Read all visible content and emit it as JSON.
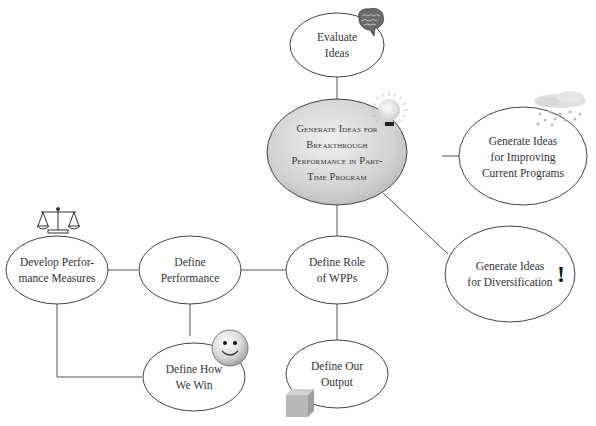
{
  "diagram": {
    "nodes": {
      "evaluate": {
        "label": "Evaluate\nIdeas"
      },
      "center": {
        "label": "Generate Ideas for\nBreakthrough\nPerformance in Part-\nTime Program"
      },
      "improve": {
        "label": "Generate Ideas\nfor Improving\nCurrent Programs"
      },
      "diversify": {
        "label": "Generate Ideas\nfor Diversification"
      },
      "role": {
        "label": "Define Role\nof WPPs"
      },
      "performance": {
        "label": "Define\nPerformance"
      },
      "measures": {
        "label": "Develop Perfor-\nmance Measures"
      },
      "win": {
        "label": "Define How\nWe Win"
      },
      "output": {
        "label": "Define Our\nOutput"
      }
    },
    "icons": {
      "brain": "brain-icon",
      "lightbulb": "lightbulb-icon",
      "rain_cloud": "rain-cloud-icon",
      "exclamation": "!",
      "scales": "scales-icon",
      "smiley": "smiley-icon",
      "cube": "cube-icon"
    },
    "colors": {
      "line": "#555555",
      "center_fill": "#d4d4d4",
      "node_fill": "#ffffff",
      "text": "#333333"
    }
  }
}
